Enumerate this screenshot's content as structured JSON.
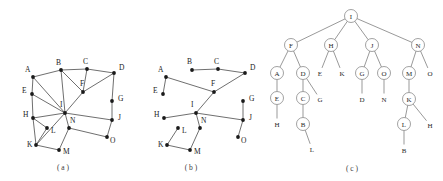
{
  "figure": {
    "panels": [
      {
        "id": "panel-a",
        "caption": "( a )",
        "caption_x": 63,
        "caption_y": 170,
        "type": "undirected-graph",
        "vertices": [
          {
            "label": "A",
            "x": 33,
            "y": 77,
            "lx": 25,
            "ly": 72
          },
          {
            "label": "B",
            "x": 61,
            "y": 70,
            "lx": 56,
            "ly": 65
          },
          {
            "label": "C",
            "x": 87,
            "y": 69,
            "lx": 83,
            "ly": 64
          },
          {
            "label": "D",
            "x": 114,
            "y": 73,
            "lx": 119,
            "ly": 70
          },
          {
            "label": "E",
            "x": 32,
            "y": 94,
            "lx": 22,
            "ly": 93
          },
          {
            "label": "F",
            "x": 83,
            "y": 92,
            "lx": 80,
            "ly": 86
          },
          {
            "label": "G",
            "x": 112,
            "y": 101,
            "lx": 118,
            "ly": 101
          },
          {
            "label": "I",
            "x": 65,
            "y": 113,
            "lx": 60,
            "ly": 107
          },
          {
            "label": "H",
            "x": 33,
            "y": 118,
            "lx": 23,
            "ly": 117
          },
          {
            "label": "J",
            "x": 112,
            "y": 120,
            "lx": 118,
            "ly": 120
          },
          {
            "label": "L",
            "x": 47,
            "y": 128,
            "lx": 51,
            "ly": 133
          },
          {
            "label": "N",
            "x": 69,
            "y": 128,
            "lx": 70,
            "ly": 123
          },
          {
            "label": "O",
            "x": 107,
            "y": 137,
            "lx": 110,
            "ly": 143
          },
          {
            "label": "K",
            "x": 36,
            "y": 145,
            "lx": 27,
            "ly": 147
          },
          {
            "label": "M",
            "x": 59,
            "y": 150,
            "lx": 63,
            "ly": 154
          }
        ],
        "edges": [
          [
            "A",
            "B"
          ],
          [
            "B",
            "C"
          ],
          [
            "C",
            "D"
          ],
          [
            "A",
            "E"
          ],
          [
            "E",
            "H"
          ],
          [
            "B",
            "F"
          ],
          [
            "C",
            "F"
          ],
          [
            "D",
            "F"
          ],
          [
            "D",
            "G"
          ],
          [
            "G",
            "J"
          ],
          [
            "F",
            "I"
          ],
          [
            "A",
            "I"
          ],
          [
            "E",
            "I"
          ],
          [
            "I",
            "H"
          ],
          [
            "I",
            "J"
          ],
          [
            "I",
            "N"
          ],
          [
            "I",
            "K"
          ],
          [
            "H",
            "L"
          ],
          [
            "H",
            "K"
          ],
          [
            "L",
            "K"
          ],
          [
            "K",
            "M"
          ],
          [
            "M",
            "N"
          ],
          [
            "N",
            "O"
          ],
          [
            "O",
            "J"
          ],
          [
            "B",
            "I"
          ]
        ]
      },
      {
        "id": "panel-b",
        "caption": "( b )",
        "caption_x": 191,
        "caption_y": 170,
        "type": "spanning-tree-graph",
        "vertices": [
          {
            "label": "A",
            "x": 166,
            "y": 77,
            "lx": 158,
            "ly": 72
          },
          {
            "label": "B",
            "x": 192,
            "y": 70,
            "lx": 187,
            "ly": 64
          },
          {
            "label": "C",
            "x": 218,
            "y": 69,
            "lx": 214,
            "ly": 64
          },
          {
            "label": "D",
            "x": 245,
            "y": 73,
            "lx": 250,
            "ly": 70
          },
          {
            "label": "E",
            "x": 163,
            "y": 94,
            "lx": 153,
            "ly": 93
          },
          {
            "label": "F",
            "x": 214,
            "y": 92,
            "lx": 211,
            "ly": 86
          },
          {
            "label": "G",
            "x": 243,
            "y": 101,
            "lx": 249,
            "ly": 101
          },
          {
            "label": "I",
            "x": 196,
            "y": 113,
            "lx": 191,
            "ly": 107
          },
          {
            "label": "H",
            "x": 164,
            "y": 118,
            "lx": 154,
            "ly": 117
          },
          {
            "label": "J",
            "x": 243,
            "y": 120,
            "lx": 249,
            "ly": 120
          },
          {
            "label": "L",
            "x": 178,
            "y": 128,
            "lx": 182,
            "ly": 133
          },
          {
            "label": "N",
            "x": 200,
            "y": 128,
            "lx": 201,
            "ly": 123
          },
          {
            "label": "O",
            "x": 238,
            "y": 137,
            "lx": 241,
            "ly": 143
          },
          {
            "label": "K",
            "x": 167,
            "y": 145,
            "lx": 158,
            "ly": 147
          },
          {
            "label": "M",
            "x": 190,
            "y": 150,
            "lx": 194,
            "ly": 154
          }
        ],
        "edges": [
          [
            "A",
            "E"
          ],
          [
            "A",
            "F"
          ],
          [
            "B",
            "C"
          ],
          [
            "C",
            "D"
          ],
          [
            "D",
            "F"
          ],
          [
            "F",
            "I"
          ],
          [
            "I",
            "H"
          ],
          [
            "I",
            "N"
          ],
          [
            "I",
            "J"
          ],
          [
            "J",
            "G"
          ],
          [
            "J",
            "O"
          ],
          [
            "N",
            "M"
          ],
          [
            "M",
            "K"
          ],
          [
            "K",
            "L"
          ]
        ]
      },
      {
        "id": "panel-c",
        "caption": "( c )",
        "caption_x": 352,
        "caption_y": 171,
        "type": "tree",
        "nodes": [
          {
            "label": "I",
            "x": 351,
            "y": 16,
            "r": 6.5,
            "circled": true
          },
          {
            "label": "F",
            "x": 291,
            "y": 45,
            "r": 6.5,
            "circled": true
          },
          {
            "label": "H",
            "x": 331,
            "y": 45,
            "r": 6.5,
            "circled": true
          },
          {
            "label": "J",
            "x": 372,
            "y": 45,
            "r": 6.5,
            "circled": true
          },
          {
            "label": "N",
            "x": 418,
            "y": 45,
            "r": 6.5,
            "circled": true
          },
          {
            "label": "A",
            "x": 277,
            "y": 73,
            "r": 6.5,
            "circled": true
          },
          {
            "label": "D",
            "x": 303,
            "y": 73,
            "r": 6.5,
            "circled": true
          },
          {
            "label": "E",
            "x": 320,
            "y": 73,
            "r": 0,
            "circled": false
          },
          {
            "label": "K",
            "x": 342,
            "y": 73,
            "r": 0,
            "circled": false
          },
          {
            "label": "G",
            "x": 362,
            "y": 73,
            "r": 6.5,
            "circled": true
          },
          {
            "label": "O",
            "x": 384,
            "y": 73,
            "r": 6.5,
            "circled": true
          },
          {
            "label": "M",
            "x": 409,
            "y": 73,
            "r": 6.5,
            "circled": true
          },
          {
            "label": "O2",
            "x": 430,
            "y": 73,
            "r": 0,
            "circled": false,
            "text": "O"
          },
          {
            "label": "E2",
            "x": 277,
            "y": 98,
            "r": 6.5,
            "circled": true,
            "text": "E"
          },
          {
            "label": "C",
            "x": 303,
            "y": 98,
            "r": 6.5,
            "circled": true
          },
          {
            "label": "G2",
            "x": 320,
            "y": 99,
            "r": 0,
            "circled": false,
            "text": "G"
          },
          {
            "label": "D2",
            "x": 362,
            "y": 99,
            "r": 0,
            "circled": false,
            "text": "D"
          },
          {
            "label": "N2",
            "x": 384,
            "y": 99,
            "r": 0,
            "circled": false,
            "text": "N"
          },
          {
            "label": "K2",
            "x": 409,
            "y": 99,
            "r": 6.5,
            "circled": true,
            "text": "K"
          },
          {
            "label": "H2",
            "x": 277,
            "y": 124,
            "r": 0,
            "circled": false,
            "text": "H"
          },
          {
            "label": "B",
            "x": 303,
            "y": 124,
            "r": 6.5,
            "circled": true
          },
          {
            "label": "L",
            "x": 404,
            "y": 124,
            "r": 6.5,
            "circled": true
          },
          {
            "label": "H3",
            "x": 430,
            "y": 125,
            "r": 0,
            "circled": false,
            "text": "H"
          },
          {
            "label": "L2",
            "x": 312,
            "y": 149,
            "r": 0,
            "circled": false,
            "text": "L"
          },
          {
            "label": "B2",
            "x": 404,
            "y": 150,
            "r": 0,
            "circled": false,
            "text": "B"
          }
        ],
        "edges": [
          [
            "I",
            "F"
          ],
          [
            "I",
            "H"
          ],
          [
            "I",
            "J"
          ],
          [
            "I",
            "N"
          ],
          [
            "F",
            "A"
          ],
          [
            "F",
            "D"
          ],
          [
            "H",
            "E"
          ],
          [
            "H",
            "K"
          ],
          [
            "J",
            "G"
          ],
          [
            "J",
            "O"
          ],
          [
            "N",
            "M"
          ],
          [
            "N",
            "O2"
          ],
          [
            "A",
            "E2"
          ],
          [
            "D",
            "C"
          ],
          [
            "D",
            "G2"
          ],
          [
            "G",
            "D2"
          ],
          [
            "O",
            "N2"
          ],
          [
            "M",
            "K2"
          ],
          [
            "E2",
            "H2"
          ],
          [
            "C",
            "B"
          ],
          [
            "B",
            "L2"
          ],
          [
            "K2",
            "L"
          ],
          [
            "K2",
            "H3"
          ],
          [
            "L",
            "B2"
          ]
        ]
      }
    ]
  }
}
